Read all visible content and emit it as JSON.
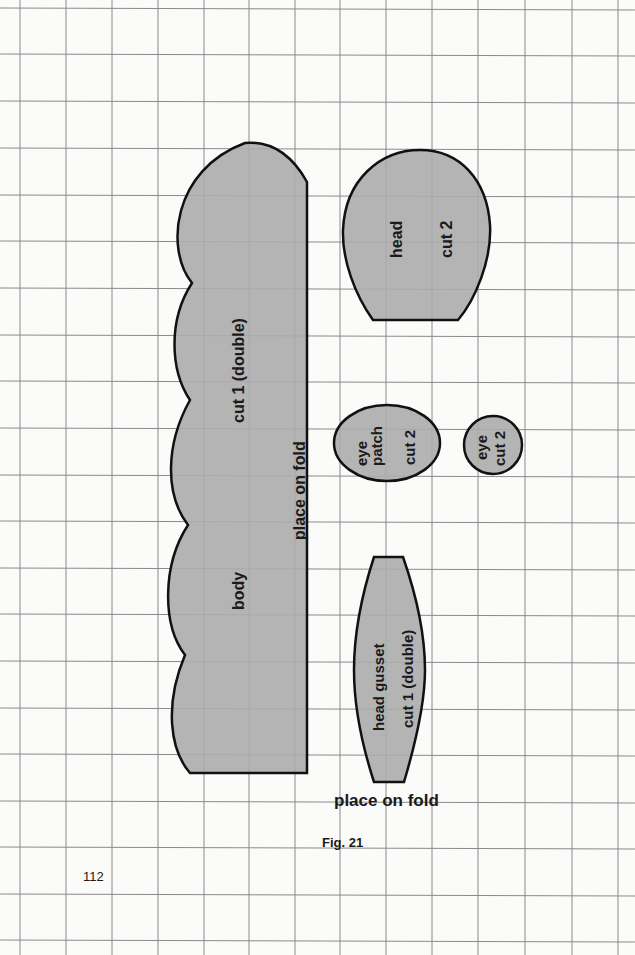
{
  "figure": {
    "caption": "Fig. 21",
    "page_number": "112",
    "background_color": "#fbfbfa",
    "grid_color": "#8a8a8a",
    "piece_fill": "#acacac",
    "outline_color": "#111111"
  },
  "pieces": {
    "body": {
      "name": "body",
      "instruction": "cut 1 (double)",
      "fold_label": "place on fold"
    },
    "head": {
      "name": "head",
      "instruction": "cut 2"
    },
    "eye_patch": {
      "name_line1": "eye",
      "name_line2": "patch",
      "instruction": "cut 2"
    },
    "eye": {
      "name": "eye",
      "instruction": "cut 2"
    },
    "head_gusset": {
      "name": "head gusset",
      "instruction": "cut 1 (double)",
      "fold_label": "place on fold"
    }
  }
}
